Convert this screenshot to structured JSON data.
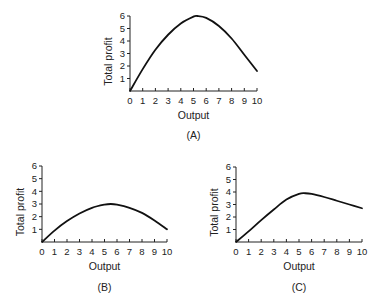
{
  "figure": {
    "panels": [
      {
        "id": "A",
        "label": "(A)",
        "xlabel": "Output",
        "ylabel": "Total profit"
      },
      {
        "id": "B",
        "label": "(B)",
        "xlabel": "Output",
        "ylabel": "Total profit"
      },
      {
        "id": "C",
        "label": "(C)",
        "xlabel": "Output",
        "ylabel": "Total profit"
      }
    ],
    "x_ticks": [
      "0",
      "1",
      "2",
      "3",
      "4",
      "5",
      "6",
      "7",
      "8",
      "9",
      "10"
    ],
    "y_ticks": [
      "1",
      "2",
      "3",
      "4",
      "5",
      "6"
    ]
  },
  "chart_data": [
    {
      "type": "line",
      "title": "(A)",
      "xlabel": "Output",
      "ylabel": "Total profit",
      "xlim": [
        0,
        10
      ],
      "ylim": [
        0,
        6
      ],
      "grid": false,
      "x": [
        0,
        1,
        2,
        3,
        4,
        5,
        5.3,
        6,
        7,
        8,
        9,
        10
      ],
      "series": [
        {
          "name": "Total profit",
          "values": [
            0,
            1.75,
            3.3,
            4.5,
            5.4,
            5.95,
            6.0,
            5.85,
            5.2,
            4.2,
            2.9,
            1.6
          ]
        }
      ],
      "x_ticks": [
        0,
        1,
        2,
        3,
        4,
        5,
        6,
        7,
        8,
        9,
        10
      ],
      "y_ticks": [
        1,
        2,
        3,
        4,
        5,
        6
      ]
    },
    {
      "type": "line",
      "title": "(B)",
      "xlabel": "Output",
      "ylabel": "Total profit",
      "xlim": [
        0,
        10
      ],
      "ylim": [
        0,
        6
      ],
      "grid": false,
      "x": [
        0,
        1,
        2,
        3,
        4,
        5,
        5.5,
        6,
        7,
        8,
        9,
        10
      ],
      "series": [
        {
          "name": "Total profit",
          "values": [
            0,
            0.9,
            1.65,
            2.25,
            2.7,
            2.95,
            3.0,
            2.95,
            2.7,
            2.3,
            1.7,
            1.0
          ]
        }
      ],
      "x_ticks": [
        0,
        1,
        2,
        3,
        4,
        5,
        6,
        7,
        8,
        9,
        10
      ],
      "y_ticks": [
        1,
        2,
        3,
        4,
        5,
        6
      ]
    },
    {
      "type": "line",
      "title": "(C)",
      "xlabel": "Output",
      "ylabel": "Total profit",
      "xlim": [
        0,
        10
      ],
      "ylim": [
        0,
        6
      ],
      "grid": false,
      "x": [
        0,
        1,
        2,
        3,
        4,
        5,
        5.5,
        6,
        7,
        8,
        9,
        10
      ],
      "series": [
        {
          "name": "Total profit",
          "values": [
            0,
            0.85,
            1.75,
            2.6,
            3.4,
            3.85,
            3.9,
            3.85,
            3.6,
            3.3,
            3.0,
            2.7
          ]
        }
      ],
      "x_ticks": [
        0,
        1,
        2,
        3,
        4,
        5,
        6,
        7,
        8,
        9,
        10
      ],
      "y_ticks": [
        1,
        2,
        3,
        4,
        5,
        6
      ]
    }
  ]
}
